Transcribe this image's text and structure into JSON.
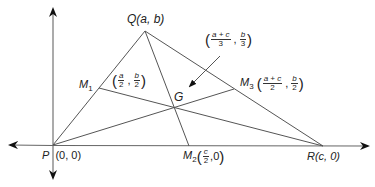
{
  "diagram": {
    "colors": {
      "line": "#555555",
      "axis": "#666666",
      "text": "#222222",
      "background": "#ffffff"
    },
    "vertices": {
      "P": {
        "name": "P",
        "coords": "(0, 0)",
        "px": [
          53,
          145
        ]
      },
      "Q": {
        "name": "Q",
        "coords": "(a, b)",
        "px": [
          145,
          31
        ]
      },
      "R": {
        "name": "R",
        "coords": "(c, 0)",
        "px": [
          323,
          146
        ]
      }
    },
    "midpoints": {
      "M1": {
        "name": "M",
        "sub": "1",
        "x_num": "a",
        "x_den": "2",
        "y_num": "b",
        "y_den": "2",
        "px": [
          99,
          88
        ]
      },
      "M2": {
        "name": "M",
        "sub": "2",
        "x_num": "c",
        "x_den": "2",
        "y_val": "0",
        "px": [
          189,
          146
        ]
      },
      "M3": {
        "name": "M",
        "sub": "3",
        "x_num": "a + c",
        "x_den": "2",
        "y_num": "b",
        "y_den": "2",
        "px": [
          234,
          89
        ]
      }
    },
    "centroid": {
      "name": "G",
      "x_num": "a + c",
      "x_den": "3",
      "y_num": "b",
      "y_den": "3",
      "px": [
        174,
        107
      ]
    },
    "labels": {
      "Q_label": "Q(a, b)",
      "P_name": "P",
      "P_coords": "(0, 0)",
      "R_label": "R(c, 0)",
      "G_label": "G",
      "open_paren": "(",
      "close_paren": ")",
      "comma": ",",
      "M2_y": ",0"
    },
    "axes": {
      "x": {
        "from": [
          8,
          145
        ],
        "to": [
          370,
          146
        ],
        "bidirectional": true
      },
      "y": {
        "from": [
          53,
          180
        ],
        "to": [
          53,
          7
        ],
        "bidirectional": true
      }
    }
  }
}
